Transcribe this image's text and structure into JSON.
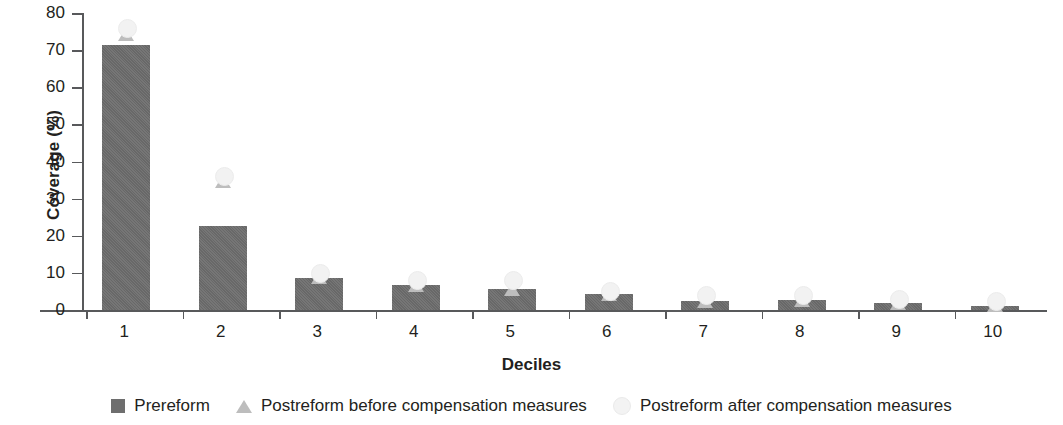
{
  "chart_data": {
    "type": "bar",
    "title": "",
    "xlabel": "Deciles",
    "ylabel": "Coverage (%)",
    "categories": [
      "1",
      "2",
      "3",
      "4",
      "5",
      "6",
      "7",
      "8",
      "9",
      "10"
    ],
    "ylim": [
      0,
      80
    ],
    "yticks": [
      0,
      10,
      20,
      30,
      40,
      50,
      60,
      70,
      80
    ],
    "grid": false,
    "legend_position": "bottom",
    "series": [
      {
        "name": "Prereform",
        "marker": "square",
        "color": "#6e6e6e",
        "values": [
          71.5,
          22.5,
          8.7,
          6.8,
          5.6,
          4.2,
          2.5,
          2.8,
          1.8,
          1.2
        ]
      },
      {
        "name": "Postreform before compensation measures",
        "marker": "triangle",
        "color": "#bdbdbd",
        "values": [
          74.0,
          34.5,
          8.5,
          6.5,
          5.5,
          4.0,
          2.2,
          2.5,
          1.5,
          1.2
        ]
      },
      {
        "name": "Postreform after compensation measures",
        "marker": "circle",
        "color": "#f2f2f2",
        "values": [
          76.0,
          36.0,
          10.0,
          8.0,
          8.0,
          5.0,
          4.0,
          4.0,
          3.0,
          2.5
        ]
      }
    ]
  }
}
